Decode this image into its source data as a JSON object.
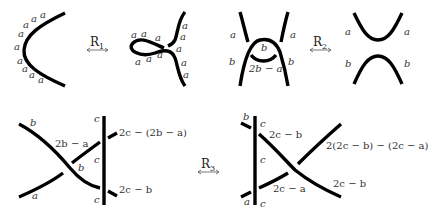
{
  "figure": {
    "moves": [
      {
        "id": "R1",
        "label": "R",
        "subscript": "1",
        "left": {
          "arc_labels": [
            "a",
            "a",
            "a",
            "a",
            "a",
            "a",
            "a",
            "a",
            "a",
            "a"
          ]
        },
        "right": {
          "arc_labels": [
            "a",
            "a",
            "a",
            "a",
            "a",
            "a",
            "a",
            "a",
            "a",
            "a",
            "a"
          ]
        }
      },
      {
        "id": "R2",
        "label": "R",
        "subscript": "2",
        "left": {
          "labels": {
            "top_left": "a",
            "top_right": "a",
            "middle_top": "b",
            "bottom_left": "b",
            "bottom_right": "b",
            "middle_bottom": "2b − a"
          }
        },
        "right": {
          "labels": {
            "top_left": "a",
            "top_right": "a",
            "bottom_left": "b",
            "bottom_right": "b"
          }
        }
      },
      {
        "id": "R3",
        "label": "R",
        "subscript": "3",
        "left": {
          "labels": {
            "b_top_left": "b",
            "a_bottom_left": "a",
            "middle_upper": "2b − a",
            "crossing_b": "b",
            "c_top": "c",
            "c_mid": "c",
            "c_bottom": "c",
            "right_top": "2c − (2b − a)",
            "right_bottom": "2c − b"
          }
        },
        "right": {
          "labels": {
            "b_top_left": "b",
            "a_bottom_left": "a",
            "c_top": "c",
            "c_mid": "c",
            "c_bottom": "c",
            "upper_inner": "2c − b",
            "lower_inner": "2c − a",
            "right_top": "2(2c − b) − (2c − a)",
            "right_bottom": "2c − b"
          }
        }
      }
    ]
  }
}
